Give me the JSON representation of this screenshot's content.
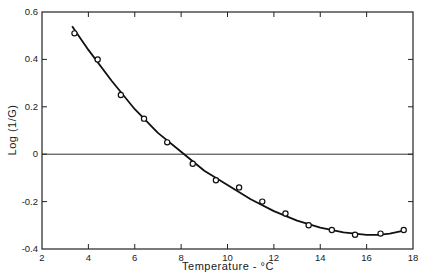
{
  "chart_data": {
    "type": "scatter",
    "title": "",
    "xlabel": "Temperature - °C",
    "ylabel": "Log (1/G)",
    "xlim": [
      2,
      18
    ],
    "ylim": [
      -0.4,
      0.6
    ],
    "x_ticks": [
      2,
      4,
      6,
      8,
      10,
      12,
      14,
      16,
      18
    ],
    "y_ticks": [
      -0.4,
      -0.2,
      0,
      0.2,
      0.4,
      0.6
    ],
    "x_tick_labels": [
      "2",
      "4",
      "6",
      "8",
      "10",
      "12",
      "14",
      "16",
      "18"
    ],
    "y_tick_labels": [
      "-0.4",
      "-0.2",
      "0",
      "0.2",
      "0.4",
      "0.6"
    ],
    "grid": false,
    "reference_line": {
      "y": 0
    },
    "series": [
      {
        "name": "observed",
        "marker": "open-circle",
        "x": [
          3.4,
          4.4,
          5.4,
          6.4,
          7.4,
          8.5,
          9.5,
          10.5,
          11.5,
          12.5,
          13.5,
          14.5,
          15.5,
          16.6,
          17.6
        ],
        "y": [
          0.51,
          0.4,
          0.25,
          0.15,
          0.05,
          -0.04,
          -0.11,
          -0.14,
          -0.2,
          -0.25,
          -0.3,
          -0.32,
          -0.34,
          -0.335,
          -0.32
        ]
      },
      {
        "name": "fitted curve",
        "marker": "line",
        "x": [
          3.3,
          4,
          5,
          6,
          7,
          8,
          9,
          10,
          11,
          12,
          13,
          14,
          15,
          16,
          16.5,
          17,
          17.5
        ],
        "y": [
          0.54,
          0.44,
          0.31,
          0.19,
          0.09,
          0.01,
          -0.07,
          -0.13,
          -0.19,
          -0.24,
          -0.28,
          -0.31,
          -0.33,
          -0.34,
          -0.34,
          -0.335,
          -0.325
        ]
      }
    ]
  }
}
